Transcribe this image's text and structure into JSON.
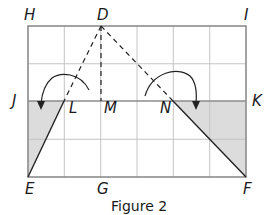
{
  "figure": {
    "caption": "Figure 2",
    "grid": {
      "columns": 6,
      "rows": 4
    },
    "points": {
      "H": "H",
      "D": "D",
      "I": "I",
      "J": "J",
      "L": "L",
      "M": "M",
      "N": "N",
      "K": "K",
      "E": "E",
      "G": "G",
      "F": "F"
    },
    "colors": {
      "grid": "#b8b8b8",
      "border": "#8c8c8c",
      "shade": "#dcdcdc",
      "ink": "#1a1a1a"
    },
    "segments": {
      "dashed": [
        "DL",
        "DM",
        "DN"
      ],
      "solid": [
        "EL",
        "NF",
        "JK"
      ]
    },
    "shaded_regions": [
      "triangle JLE",
      "triangle NKF (quadrilateral region)"
    ],
    "arrows": [
      "curved arrow L to J side",
      "curved arrow N to K side"
    ]
  }
}
